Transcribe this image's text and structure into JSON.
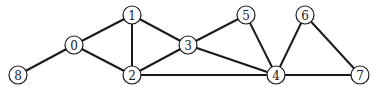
{
  "graph": {
    "type": "undirected",
    "node_radius": 9,
    "colors": {
      "edge": "#1a1a1a",
      "node_fill": "#ffffff",
      "node_stroke": "#1a1a1a",
      "background": "#ffffff"
    },
    "nodes": [
      {
        "id": "0",
        "label": "0",
        "x": 74,
        "y": 45
      },
      {
        "id": "1",
        "label": "1",
        "x": 132,
        "y": 15
      },
      {
        "id": "2",
        "label": "2",
        "x": 132,
        "y": 75
      },
      {
        "id": "3",
        "label": "3",
        "x": 188,
        "y": 45
      },
      {
        "id": "4",
        "label": "4",
        "x": 276,
        "y": 75
      },
      {
        "id": "5",
        "label": "5",
        "x": 246,
        "y": 15
      },
      {
        "id": "6",
        "label": "6",
        "x": 305,
        "y": 15
      },
      {
        "id": "7",
        "label": "7",
        "x": 360,
        "y": 75
      },
      {
        "id": "8",
        "label": "8",
        "x": 18,
        "y": 75
      }
    ],
    "edges": [
      [
        "0",
        "1"
      ],
      [
        "0",
        "2"
      ],
      [
        "0",
        "8"
      ],
      [
        "1",
        "2"
      ],
      [
        "1",
        "3"
      ],
      [
        "2",
        "3"
      ],
      [
        "2",
        "4"
      ],
      [
        "3",
        "5"
      ],
      [
        "3",
        "4"
      ],
      [
        "5",
        "4"
      ],
      [
        "4",
        "6"
      ],
      [
        "4",
        "7"
      ],
      [
        "6",
        "7"
      ]
    ]
  }
}
